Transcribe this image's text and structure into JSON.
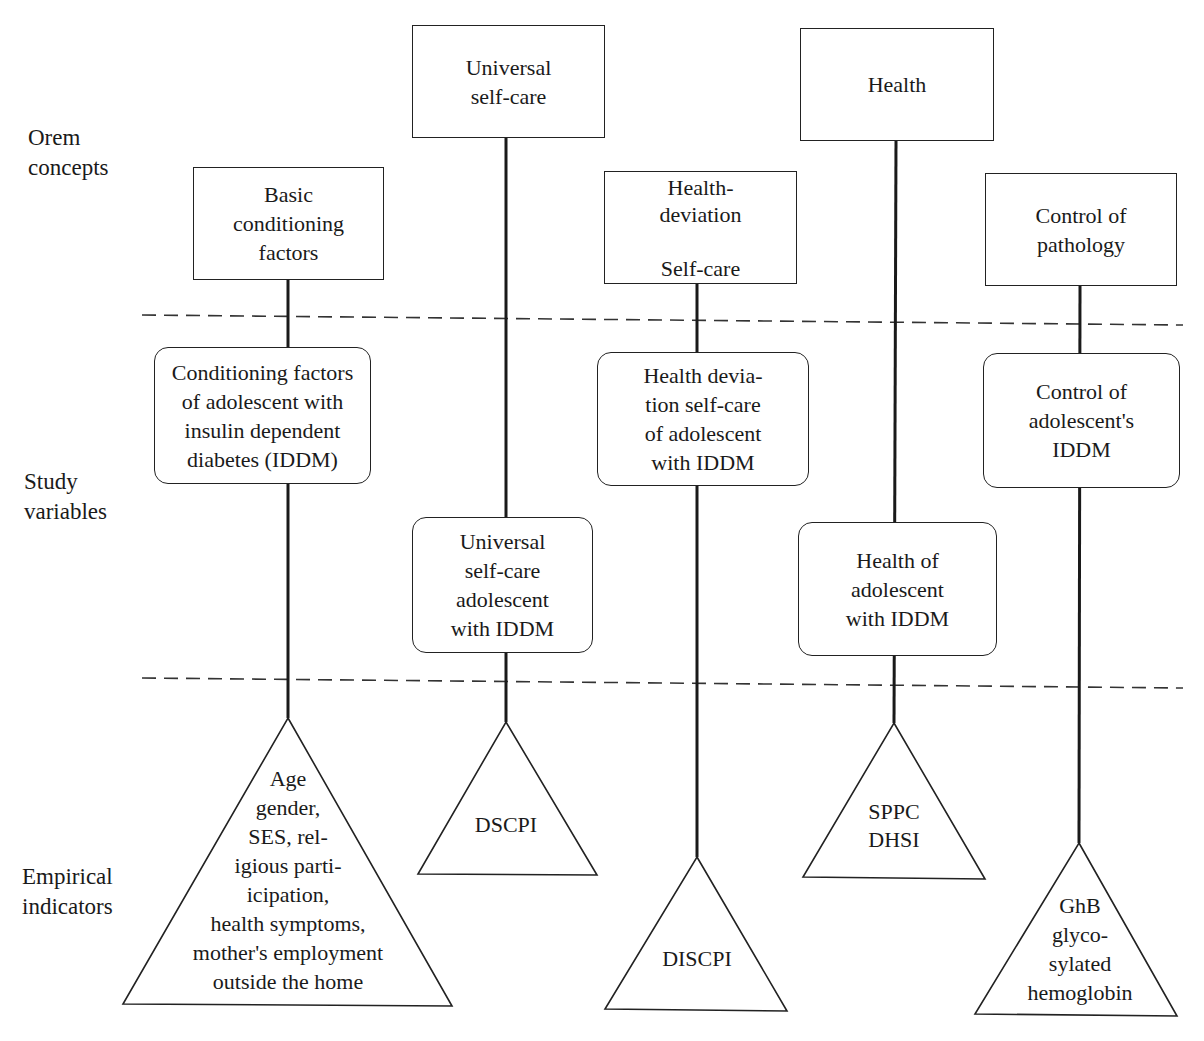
{
  "row_labels": {
    "concepts": "Orem\nconcepts",
    "variables": "Study\nvariables",
    "indicators": "Empirical\nindicators"
  },
  "columns": [
    {
      "concept": "Basic\nconditioning\nfactors",
      "variable": "Conditioning factors\nof adolescent with\ninsulin dependent\ndiabetes (IDDM)",
      "indicator": "Age\ngender,\nSES, rel-\nigious parti-\nicipation,\nhealth symptoms,\nmother's employment\noutside the home"
    },
    {
      "concept": "Universal\nself-care",
      "variable": "Universal\nself-care\nadolescent\nwith IDDM",
      "indicator": "DSCPI"
    },
    {
      "concept": "Health-\ndeviation\n\nSelf-care",
      "variable": "Health devia-\ntion self-care\nof adolescent\nwith IDDM",
      "indicator": "DISCPI"
    },
    {
      "concept": "Health",
      "variable": "Health of\nadolescent\nwith IDDM",
      "indicator": "SPPC\nDHSI"
    },
    {
      "concept": "Control of\npathology",
      "variable": "Control of\nadolescent's\nIDDM",
      "indicator": "GhB\nglyco-\nsylated\nhemoglobin"
    }
  ],
  "colors": {
    "line": "#1a1a1a",
    "dash": "#333333",
    "background": "#ffffff"
  }
}
